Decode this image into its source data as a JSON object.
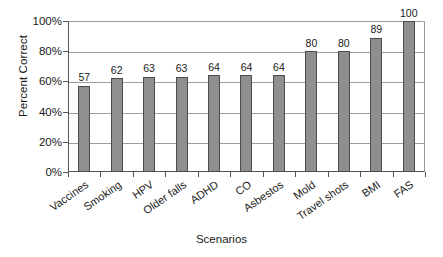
{
  "chart_data": {
    "type": "bar",
    "title": "",
    "xlabel": "Scenarios",
    "ylabel": "Percent Correct",
    "categories": [
      "Vaccines",
      "Smoking",
      "HPV",
      "Older falls",
      "ADHD",
      "CO",
      "Asbestos",
      "Mold",
      "Travel shots",
      "BMI",
      "FAS"
    ],
    "values": [
      57,
      62,
      63,
      63,
      64,
      64,
      64,
      80,
      80,
      89,
      100
    ],
    "value_labels": [
      "57",
      "62",
      "63",
      "63",
      "64",
      "64",
      "64",
      "80",
      "80",
      "89",
      "100"
    ],
    "ylim": [
      0,
      100
    ],
    "ytick_values": [
      0,
      20,
      40,
      60,
      80,
      100
    ],
    "ytick_labels": [
      "0%",
      "20%",
      "40%",
      "60%",
      "80%",
      "100%"
    ],
    "grid": true,
    "legend": false,
    "legend_position": "none",
    "bar_fill_color": "#8f8f8f",
    "bar_border_color": "#4c4c4c",
    "gridline_color": "#9d9d9d",
    "axis_color": "#555555",
    "text_color": "#1a1a1a",
    "background_color": "#ffffff"
  }
}
